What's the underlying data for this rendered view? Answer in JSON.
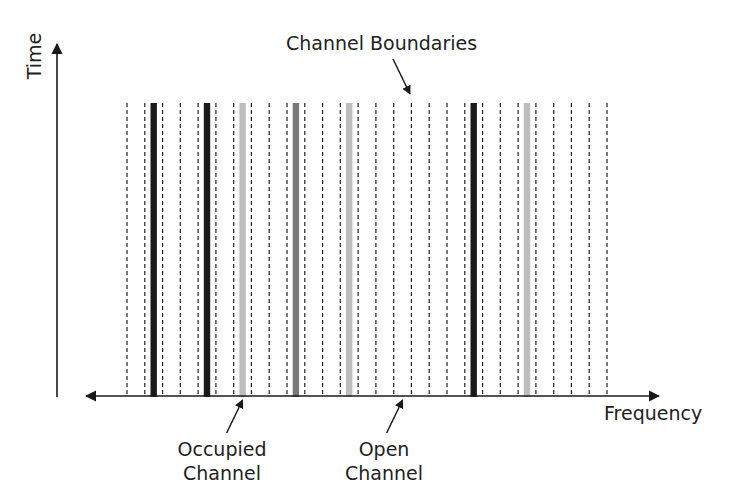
{
  "diagram": {
    "title_annotation": "Channel Boundaries",
    "y_axis_label": "Time",
    "x_axis_label": "Frequency",
    "annotations": {
      "occupied": [
        "Occupied",
        "Channel"
      ],
      "open": [
        "Open",
        "Channel"
      ]
    },
    "colors": {
      "axis": "#1a1a1a",
      "boundary": "#222222",
      "occupied_strong": "#1a1a1a",
      "occupied_medium": "#7a7a7a",
      "occupied_light": "#bdbdbd"
    },
    "channel_count": 27,
    "occupied_channels": [
      {
        "index": 1,
        "intensity": "strong"
      },
      {
        "index": 4,
        "intensity": "strong"
      },
      {
        "index": 6,
        "intensity": "light"
      },
      {
        "index": 9,
        "intensity": "medium"
      },
      {
        "index": 12,
        "intensity": "light"
      },
      {
        "index": 19,
        "intensity": "strong"
      },
      {
        "index": 22,
        "intensity": "light"
      }
    ],
    "occupied_annotation_channel": 6,
    "open_annotation_channel": 15
  }
}
